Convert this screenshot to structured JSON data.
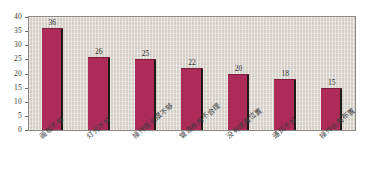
{
  "chart_data": {
    "type": "bar",
    "title": "",
    "subtitle": "",
    "xlabel": "",
    "ylabel": "",
    "ylim": [
      0,
      40
    ],
    "ytick_step": 5,
    "yticks": [
      "0",
      "5",
      "10",
      "15",
      "20",
      "25",
      "30",
      "35",
      "40"
    ],
    "grid": true,
    "grid_orientation": "vertical",
    "legend": false,
    "legend_position": "none",
    "bar_color": "#ad2b59",
    "bar_edge_color": "#1d1a18",
    "plot_background": "#d3cfc7",
    "page_background": "#ffffff",
    "categories": [
      "画板不够",
      "灯光不好",
      "操作面长度不够",
      "管道布局不合理",
      "没有储藏位置",
      "通风不好",
      "操作台面布置"
    ],
    "values": [
      36,
      26,
      25,
      22,
      20,
      18,
      15
    ],
    "value_labels": [
      "36",
      "26",
      "25",
      "22",
      "20",
      "18",
      "15"
    ],
    "series": [
      {
        "name": "数量",
        "values": [
          36,
          26,
          25,
          22,
          20,
          18,
          15
        ]
      }
    ]
  }
}
